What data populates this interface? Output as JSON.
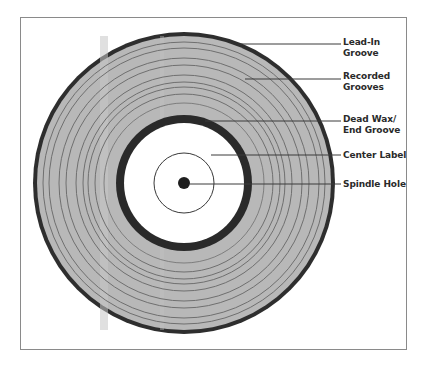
{
  "diagram": {
    "colors": {
      "frame": "#8a8a8a",
      "vinyl": "#b8b8b8",
      "vinyl_sheen": "#c8c8c8",
      "groove": "#6f6f6f",
      "outer_ring": "#2e2e2e",
      "dead_wax_ring": "#2a2a2a",
      "label_fill": "#ffffff",
      "spindle": "#1e1e1e",
      "leader_line": "#3a3a3a",
      "text": "#2a2a2a"
    },
    "labels": [
      {
        "id": "lead-in-groove",
        "lines": [
          "Lead-In",
          "Groove"
        ]
      },
      {
        "id": "recorded-grooves",
        "lines": [
          "Recorded",
          "Grooves"
        ]
      },
      {
        "id": "dead-wax-end-groove",
        "lines": [
          "Dead Wax/",
          "End Groove"
        ]
      },
      {
        "id": "center-label",
        "lines": [
          "Center Label"
        ]
      },
      {
        "id": "spindle-hole",
        "lines": [
          "Spindle Hole"
        ]
      }
    ]
  }
}
